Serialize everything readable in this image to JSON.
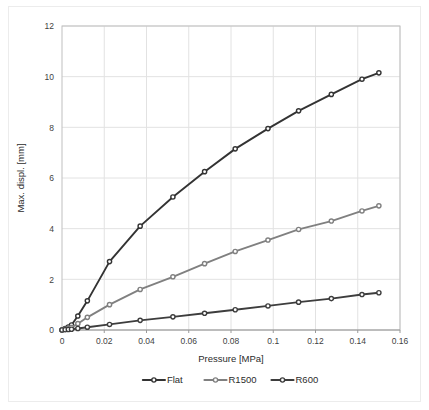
{
  "chart_data": {
    "type": "line",
    "title": "",
    "xlabel": "Pressure [MPa]",
    "ylabel": "Max. displ. [mm]",
    "xlim": [
      0,
      0.16
    ],
    "ylim": [
      0,
      12
    ],
    "xticks": [
      "0",
      "0.02",
      "0.04",
      "0.06",
      "0.08",
      "0.1",
      "0.12",
      "0.14",
      "0.16"
    ],
    "xtick_values": [
      0,
      0.02,
      0.04,
      0.06,
      0.08,
      0.1,
      0.12,
      0.14,
      0.16
    ],
    "yticks": [
      "0",
      "2",
      "4",
      "6",
      "8",
      "10",
      "12"
    ],
    "ytick_values": [
      0,
      2,
      4,
      6,
      8,
      10,
      12
    ],
    "grid": true,
    "legend_position": "bottom",
    "markers": true,
    "series": [
      {
        "name": "Flat",
        "color": "#333333",
        "marker": "circle",
        "x": [
          0,
          0.0015,
          0.003,
          0.0045,
          0.0075,
          0.012,
          0.0225,
          0.037,
          0.0525,
          0.0675,
          0.082,
          0.0975,
          0.112,
          0.1275,
          0.142,
          0.15
        ],
        "y": [
          0,
          0.06,
          0.12,
          0.2,
          0.55,
          1.15,
          2.7,
          4.1,
          5.25,
          6.25,
          7.15,
          7.95,
          8.65,
          9.3,
          9.9,
          10.15
        ]
      },
      {
        "name": "R1500",
        "color": "#808080",
        "marker": "circle",
        "x": [
          0,
          0.0015,
          0.003,
          0.0045,
          0.0075,
          0.012,
          0.0225,
          0.037,
          0.0525,
          0.0675,
          0.082,
          0.0975,
          0.112,
          0.1275,
          0.142,
          0.15
        ],
        "y": [
          0,
          0.03,
          0.06,
          0.1,
          0.25,
          0.5,
          1.0,
          1.6,
          2.1,
          2.62,
          3.1,
          3.55,
          3.97,
          4.3,
          4.7,
          4.9
        ]
      },
      {
        "name": "R600",
        "color": "#3d3d3d",
        "marker": "circle",
        "x": [
          0,
          0.0015,
          0.003,
          0.0045,
          0.0075,
          0.012,
          0.0225,
          0.037,
          0.0525,
          0.0675,
          0.082,
          0.0975,
          0.112,
          0.1275,
          0.142,
          0.15
        ],
        "y": [
          0,
          0.01,
          0.02,
          0.03,
          0.06,
          0.11,
          0.22,
          0.38,
          0.52,
          0.66,
          0.8,
          0.95,
          1.1,
          1.24,
          1.4,
          1.47
        ]
      }
    ]
  },
  "legend": {
    "items": [
      {
        "label": "Flat",
        "color": "#333333"
      },
      {
        "label": "R1500",
        "color": "#808080"
      },
      {
        "label": "R600",
        "color": "#3d3d3d"
      }
    ]
  },
  "style": {
    "grid_color": "#e2e2e2",
    "frame_color": "#bfbfbf",
    "background": "#ffffff",
    "text_color": "#3f3f3f"
  }
}
